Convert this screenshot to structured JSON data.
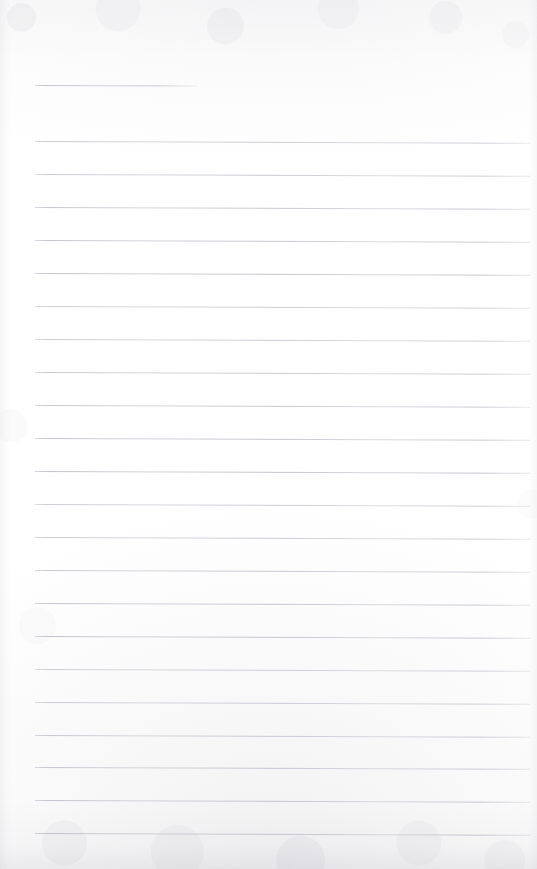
{
  "document": {
    "kind": "scanned-blank-ruled-page",
    "title": "Blank Lined Notebook Page",
    "page_width": 537,
    "page_height": 869,
    "background_color": "#ffffff",
    "paper_tint": "#fbfbfc",
    "rule_color": "#bdbdc6",
    "content_text": "",
    "has_handwriting": false,
    "has_margin_rule": false,
    "rule_geometry": {
      "left_x": 35,
      "right_x": 530,
      "short_rule_right_x": 197,
      "spacing_px": 33,
      "slope_px_over_width": 2,
      "first_rule_y": 85,
      "body_first_rule_y": 141,
      "last_rule_y": 833
    },
    "rules": [
      {
        "id": "rule-01",
        "y": 85,
        "left": 35,
        "width": 162,
        "variant": "short"
      },
      {
        "id": "rule-02",
        "y": 141,
        "left": 35,
        "width": 495,
        "variant": "full"
      },
      {
        "id": "rule-03",
        "y": 174,
        "left": 35,
        "width": 495,
        "variant": "full"
      },
      {
        "id": "rule-04",
        "y": 207,
        "left": 35,
        "width": 495,
        "variant": "full"
      },
      {
        "id": "rule-05",
        "y": 240,
        "left": 35,
        "width": 495,
        "variant": "full"
      },
      {
        "id": "rule-06",
        "y": 273,
        "left": 35,
        "width": 495,
        "variant": "full"
      },
      {
        "id": "rule-07",
        "y": 306,
        "left": 35,
        "width": 495,
        "variant": "full"
      },
      {
        "id": "rule-08",
        "y": 339,
        "left": 35,
        "width": 495,
        "variant": "full"
      },
      {
        "id": "rule-09",
        "y": 372,
        "left": 35,
        "width": 495,
        "variant": "full"
      },
      {
        "id": "rule-10",
        "y": 405,
        "left": 35,
        "width": 495,
        "variant": "full"
      },
      {
        "id": "rule-11",
        "y": 438,
        "left": 35,
        "width": 495,
        "variant": "full"
      },
      {
        "id": "rule-12",
        "y": 471,
        "left": 35,
        "width": 495,
        "variant": "full"
      },
      {
        "id": "rule-13",
        "y": 504,
        "left": 35,
        "width": 495,
        "variant": "full"
      },
      {
        "id": "rule-14",
        "y": 537,
        "left": 35,
        "width": 495,
        "variant": "full"
      },
      {
        "id": "rule-15",
        "y": 570,
        "left": 35,
        "width": 495,
        "variant": "full"
      },
      {
        "id": "rule-16",
        "y": 603,
        "left": 35,
        "width": 495,
        "variant": "full"
      },
      {
        "id": "rule-17",
        "y": 636,
        "left": 35,
        "width": 495,
        "variant": "full"
      },
      {
        "id": "rule-18",
        "y": 669,
        "left": 35,
        "width": 495,
        "variant": "full"
      },
      {
        "id": "rule-19",
        "y": 702,
        "left": 35,
        "width": 495,
        "variant": "full"
      },
      {
        "id": "rule-20",
        "y": 735,
        "left": 35,
        "width": 495,
        "variant": "full"
      },
      {
        "id": "rule-21",
        "y": 767,
        "left": 35,
        "width": 495,
        "variant": "full"
      },
      {
        "id": "rule-22",
        "y": 800,
        "left": 35,
        "width": 495,
        "variant": "full"
      },
      {
        "id": "rule-23",
        "y": 833,
        "left": 35,
        "width": 495,
        "variant": "full"
      }
    ]
  }
}
